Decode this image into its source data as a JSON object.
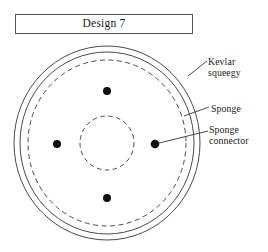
{
  "figure": {
    "title_box": {
      "label": "Design 7"
    },
    "callouts": [
      {
        "key": "kevlar",
        "text": "Kevlar\nsqueegy",
        "name": "kevlar-squeegy-label"
      },
      {
        "key": "sponge",
        "text": "Sponge",
        "name": "sponge-label"
      },
      {
        "key": "connector",
        "text": "Sponge\nconnector",
        "name": "sponge-connector-label"
      }
    ],
    "geometry": {
      "center": {
        "x": 107,
        "y": 143
      },
      "rings": [
        {
          "name": "outer-ring-kevlar-squeegy",
          "radius_x": 93,
          "radius_y": 97,
          "style": "solid"
        },
        {
          "name": "middle-ring",
          "radius_x": 87,
          "radius_y": 91,
          "style": "solid"
        },
        {
          "name": "sponge-ring-dashed",
          "radius_x": 79,
          "radius_y": 83,
          "style": "dashed"
        },
        {
          "name": "inner-hub-dashed",
          "radius_x": 27,
          "radius_y": 27,
          "style": "dashed"
        }
      ],
      "connectors": [
        {
          "name": "sponge-connector-top",
          "x": 107,
          "y": 91,
          "r": 4
        },
        {
          "name": "sponge-connector-left",
          "x": 57,
          "y": 144,
          "r": 4
        },
        {
          "name": "sponge-connector-right",
          "x": 155,
          "y": 144,
          "r": 4
        },
        {
          "name": "sponge-connector-bottom",
          "x": 107,
          "y": 198,
          "r": 4
        }
      ],
      "leader_lines": [
        {
          "name": "leader-line-kevlar",
          "x1": 188,
          "y1": 76,
          "x2": 207,
          "y2": 61
        },
        {
          "name": "leader-line-sponge",
          "x1": 184,
          "y1": 116,
          "x2": 209,
          "y2": 107
        },
        {
          "name": "leader-line-connector",
          "x1": 155,
          "y1": 144,
          "x2": 208,
          "y2": 131
        }
      ]
    },
    "colors": {
      "stroke": "#4a4a4a",
      "dot_fill": "#111111",
      "box_border": "#555555",
      "background": "#ffffff",
      "text": "#1a1a1a"
    }
  }
}
